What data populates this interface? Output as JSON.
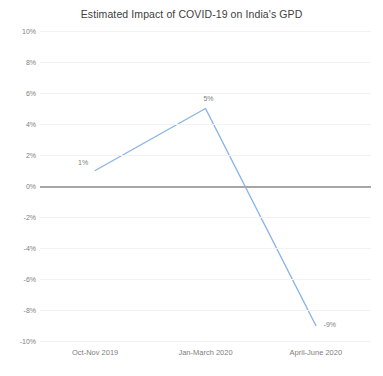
{
  "chart_data": {
    "type": "line",
    "title": "Estimated Impact of COVID-19 on India's GPD",
    "xlabel": "",
    "ylabel": "",
    "categories": [
      "Oct-Nov 2019",
      "Jan-March 2020",
      "April-June 2020"
    ],
    "values": [
      1,
      5,
      -9
    ],
    "point_labels": [
      "1%",
      "5%",
      "-9%"
    ],
    "series": [
      {
        "name": "Estimated Impact",
        "values": [
          1,
          5,
          -9
        ],
        "color": "#8ab4e8"
      }
    ],
    "ylim": [
      -10,
      10
    ],
    "ytick_values": [
      10,
      8,
      6,
      4,
      2,
      0,
      -2,
      -4,
      -6,
      -8,
      -10
    ],
    "ytick_labels": [
      "10%",
      "8%",
      "6%",
      "4%",
      "2%",
      "0%",
      "-2%",
      "-4%",
      "-6%",
      "-8%",
      "-10%"
    ],
    "grid": true,
    "grid_color": "#f2f2f2",
    "zero_line_color": "#a6a6a6",
    "legend": false,
    "legend_position": "none",
    "background": "#ffffff",
    "markers": false
  }
}
